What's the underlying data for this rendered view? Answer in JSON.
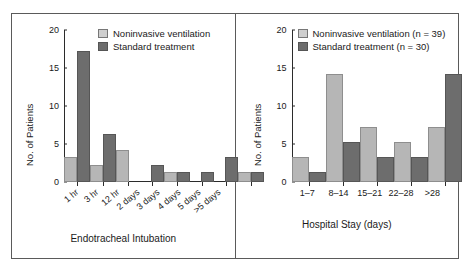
{
  "figure": {
    "panels": [
      {
        "id": "endotracheal-intubation",
        "ylabel": "No. of Patients",
        "xlabel": "Endotracheal Intubation",
        "yticks": [
          "0",
          "5",
          "10",
          "15",
          "20"
        ],
        "legend": [
          {
            "label": "Noninvasive ventilation",
            "swatch": "light-gray"
          },
          {
            "label": "Standard treatment",
            "swatch": "dark-gray"
          }
        ]
      },
      {
        "id": "hospital-stay",
        "ylabel": "No. of Patients",
        "xlabel": "Hospital Stay (days)",
        "yticks": [
          "0",
          "5",
          "10",
          "15",
          "20"
        ],
        "legend": [
          {
            "label": "Noninvasive ventilation (n = 39)",
            "swatch": "light-gray"
          },
          {
            "label": "Standard treatment (n = 30)",
            "swatch": "dark-gray"
          }
        ]
      }
    ]
  },
  "chart_data": [
    {
      "type": "bar",
      "title": "",
      "xlabel": "Endotracheal Intubation",
      "ylabel": "No. of Patients",
      "ylim": [
        0,
        20
      ],
      "yticks": [
        0,
        5,
        10,
        15,
        20
      ],
      "grid": false,
      "legend_position": "top-right",
      "categories": [
        "1 hr",
        "3 hr",
        "12 hr",
        "2 days",
        "3 days",
        "4 days",
        "5 days",
        ">5 days"
      ],
      "series": [
        {
          "name": "Noninvasive ventilation",
          "color": "#b6b6b6",
          "values": [
            3,
            2,
            4,
            0,
            1,
            0,
            0,
            1
          ]
        },
        {
          "name": "Standard treatment",
          "color": "#6d6d6d",
          "values": [
            17,
            6,
            0,
            2,
            1,
            1,
            3,
            1
          ]
        }
      ]
    },
    {
      "type": "bar",
      "title": "",
      "xlabel": "Hospital Stay (days)",
      "ylabel": "No. of Patients",
      "ylim": [
        0,
        20
      ],
      "yticks": [
        0,
        5,
        10,
        15,
        20
      ],
      "grid": false,
      "legend_position": "top-right",
      "categories": [
        "1–7",
        "8–14",
        "15–21",
        "22–28",
        ">28"
      ],
      "series": [
        {
          "name": "Noninvasive ventilation (n = 39)",
          "color": "#b6b6b6",
          "values": [
            3,
            14,
            7,
            5,
            7
          ]
        },
        {
          "name": "Standard treatment (n = 30)",
          "color": "#6d6d6d",
          "values": [
            1,
            5,
            3,
            3,
            14
          ]
        }
      ]
    }
  ]
}
